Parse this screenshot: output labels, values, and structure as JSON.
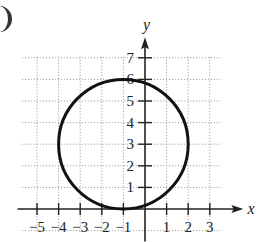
{
  "chart_data": {
    "type": "line",
    "title": "",
    "xlabel": "x",
    "ylabel": "y",
    "xlim": [
      -5.5,
      3.5
    ],
    "ylim": [
      -1,
      7.5
    ],
    "grid": true,
    "x_ticks": [
      -5,
      -4,
      -3,
      -2,
      -1,
      1,
      2,
      3
    ],
    "y_ticks": [
      1,
      2,
      3,
      4,
      5,
      6,
      7
    ],
    "x_tick_labels": [
      "−5",
      "−4",
      "−3",
      "−2",
      "−1",
      "1",
      "2",
      "3"
    ],
    "y_tick_labels": [
      "1",
      "2",
      "3",
      "4",
      "5",
      "6",
      "7"
    ],
    "series": [
      {
        "name": "circle",
        "shape": "circle",
        "center": [
          -1,
          3
        ],
        "radius": 3,
        "equation": "(x + 1)^2 + (y - 3)^2 = 9",
        "extremes": {
          "left": [
            -4,
            3
          ],
          "right": [
            2,
            3
          ],
          "top": [
            -1,
            6
          ],
          "bottom": [
            -1,
            0
          ]
        }
      }
    ],
    "legend": null
  },
  "labels": {
    "x_axis": "x",
    "y_axis": "y"
  }
}
